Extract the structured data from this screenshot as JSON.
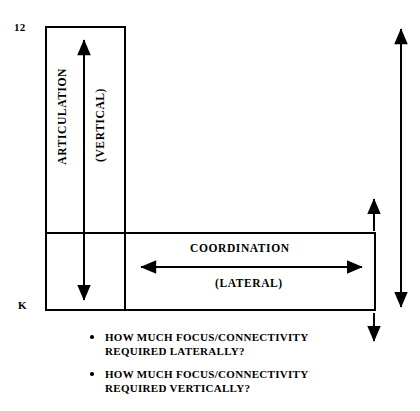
{
  "diagram": {
    "type": "l-shaped-matrix-diagram",
    "axis": {
      "top_label": "12",
      "bottom_label": "K"
    },
    "vertical_region": {
      "title": "ARTICULATION",
      "subtitle": "(VERTICAL)",
      "arrow": "double-headed-vertical-arrow"
    },
    "horizontal_region": {
      "title": "COORDINATION",
      "subtitle": "(LATERAL)",
      "arrow": "double-headed-horizontal-arrow"
    },
    "side_arrows": {
      "inner_up": "up-arrow",
      "inner_down": "down-arrow",
      "outer_span": "double-headed-vertical-arrow"
    },
    "colors": {
      "stroke": "#000000",
      "background": "#ffffff"
    }
  },
  "questions": [
    {
      "line1": "HOW MUCH FOCUS/CONNECTIVITY",
      "line2": "REQUIRED LATERALLY?"
    },
    {
      "line1": "HOW MUCH FOCUS/CONNECTIVITY",
      "line2": "REQUIRED VERTICALLY?"
    }
  ]
}
